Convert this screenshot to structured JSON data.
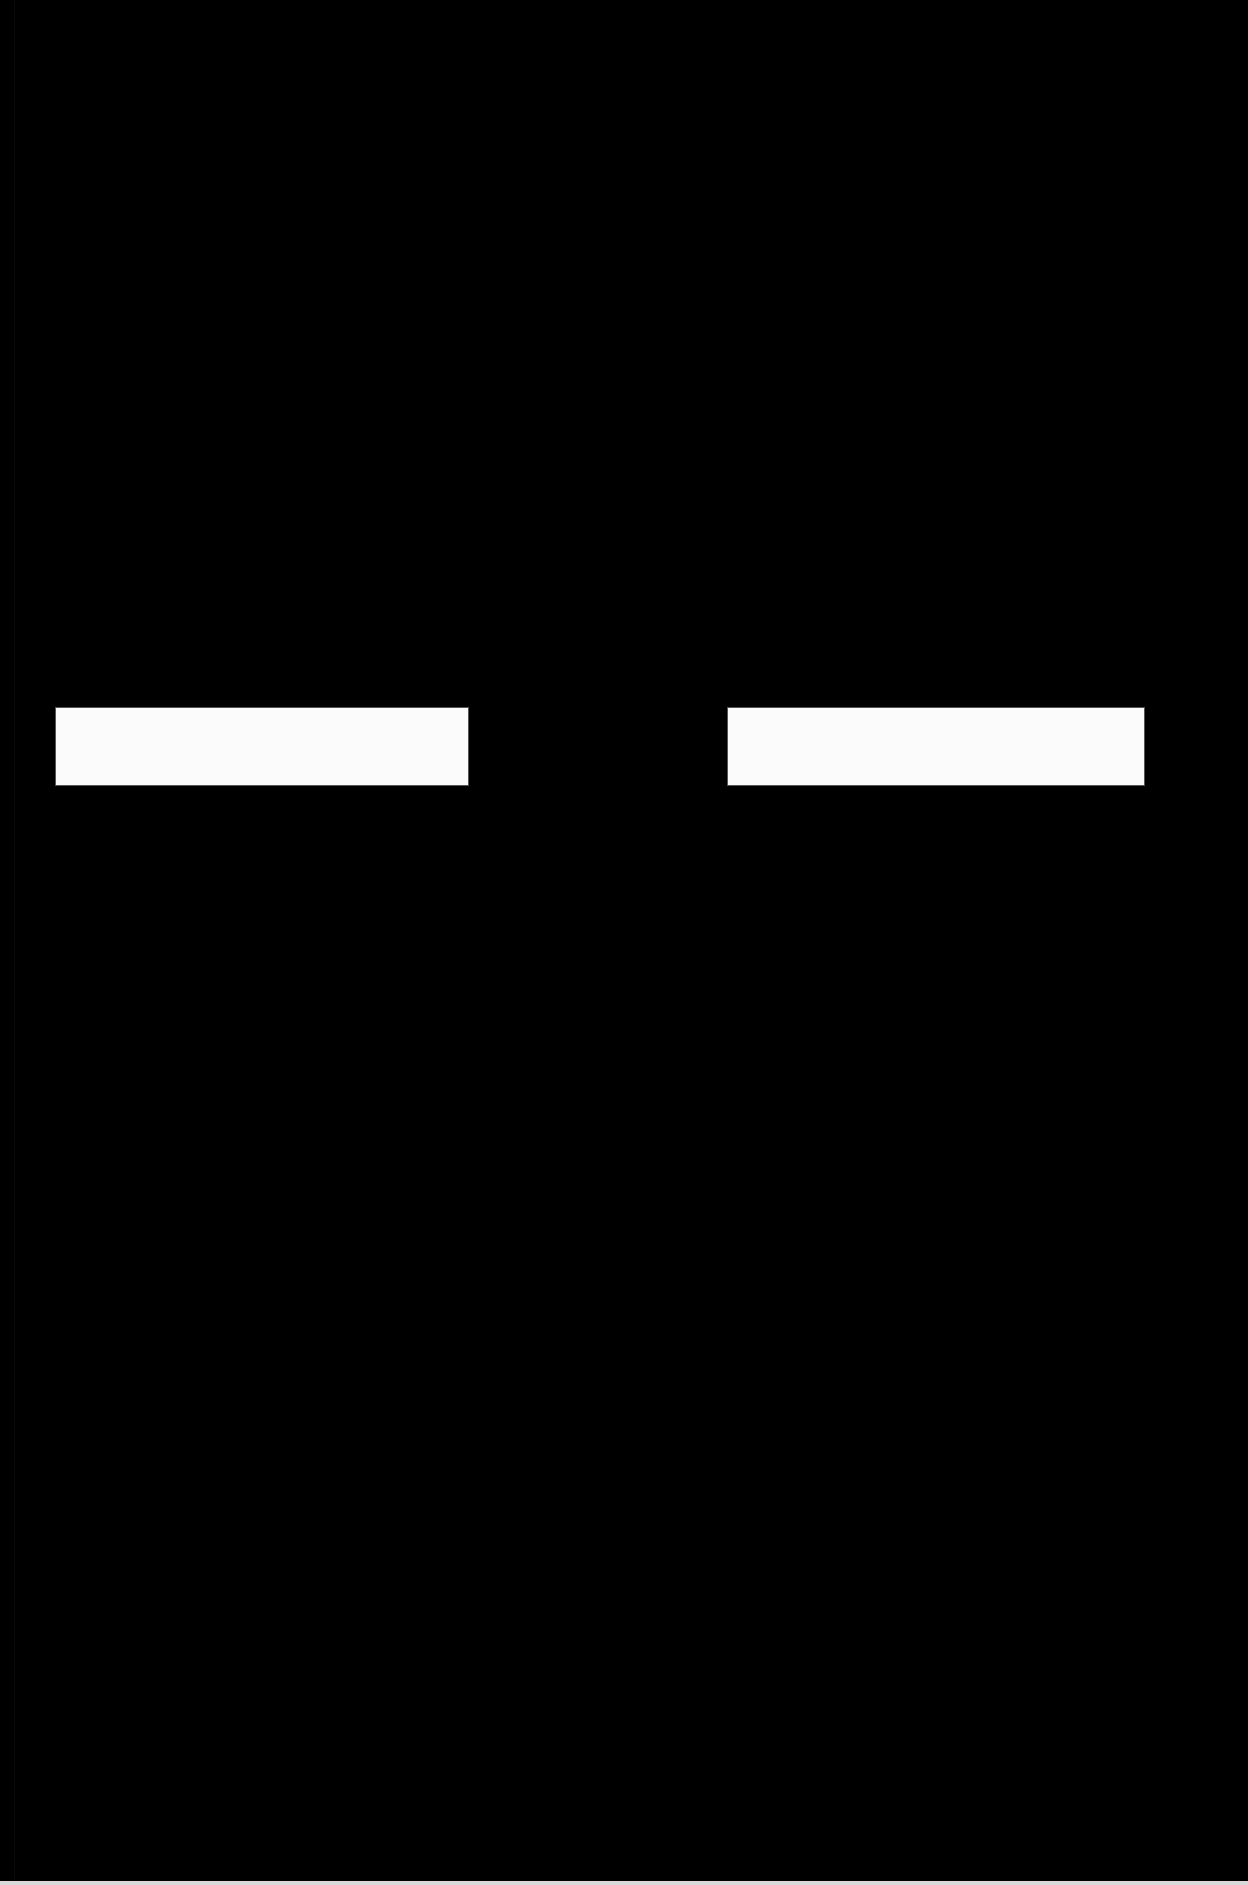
{
  "page": {
    "background_color": "#000000"
  },
  "fields": [
    {
      "value": "",
      "color": "#fbfbfb"
    },
    {
      "value": "",
      "color": "#fbfbfb"
    }
  ],
  "bottom_strip": {
    "color": "#d9d9d9"
  }
}
